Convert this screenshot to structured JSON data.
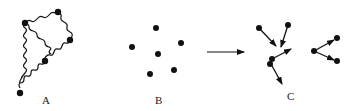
{
  "panels": [
    {
      "id": "A",
      "label": "A",
      "description": "particles linked by wavy chains"
    },
    {
      "id": "B",
      "label": "B",
      "description": "isolated particles"
    },
    {
      "id": "C",
      "label": "C",
      "description": "particles with motion vectors"
    }
  ],
  "transition_arrow": {
    "from": "B",
    "to": "C"
  },
  "colors": {
    "ink": "#111111",
    "background": "#ffffff"
  }
}
